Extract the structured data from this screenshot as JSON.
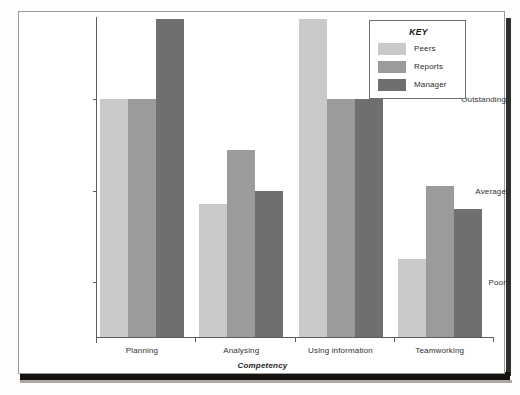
{
  "figure": {
    "axis_color": "#5c5c5c",
    "frame_color": "#9a9a96"
  },
  "legend": {
    "title": "KEY",
    "entries": [
      {
        "label": "Peers",
        "color": "#c9c9c9"
      },
      {
        "label": "Reports",
        "color": "#9b9b9b"
      },
      {
        "label": "Manager",
        "color": "#6f6f6f"
      }
    ]
  },
  "chart_data": {
    "type": "bar",
    "title": "",
    "xlabel": "Competency",
    "ylabel": "",
    "categories": [
      "Planning",
      "Analysing",
      "Using information",
      "Teamworking"
    ],
    "ytick_labels": [
      "Poor",
      "Average",
      "Outstanding"
    ],
    "ytick_values": [
      1,
      2,
      3
    ],
    "ylim": [
      0.4,
      3.9
    ],
    "grid": false,
    "legend_position": "top-right",
    "series": [
      {
        "name": "Peers",
        "color": "#c9c9c9",
        "values": [
          3.0,
          1.85,
          3.88,
          1.25
        ]
      },
      {
        "name": "Reports",
        "color": "#9b9b9b",
        "values": [
          3.0,
          2.45,
          3.0,
          2.05
        ]
      },
      {
        "name": "Manager",
        "color": "#6f6f6f",
        "values": [
          3.88,
          2.0,
          3.0,
          1.8
        ]
      }
    ]
  }
}
